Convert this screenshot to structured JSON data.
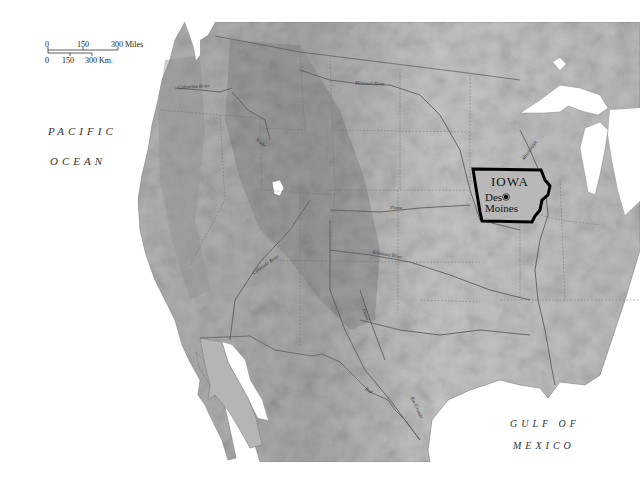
{
  "map": {
    "title": "Location of Iowa in the United States",
    "highlighted_state": "IOWA",
    "capital": "Des Moines",
    "colors": {
      "background": "#ffffff",
      "land": "#bdbdbd",
      "land_light": "#d6d6d6",
      "mountains": "#9a9a9a",
      "water": "#ffffff",
      "iowa_border": "#000000",
      "state_lines": "#6e6e6e"
    }
  },
  "scale_bar": {
    "miles": {
      "ticks": [
        "0",
        "150",
        "300 Miles"
      ]
    },
    "km": {
      "ticks": [
        "0",
        "150",
        "300 Km."
      ]
    }
  },
  "water_labels": {
    "pacific_line1": "PACIFIC",
    "pacific_line2": "OCEAN",
    "gulf_line1": "GULF OF",
    "gulf_line2": "MEXICO"
  },
  "rivers": [
    {
      "name": "Columbia River",
      "label": "Columbia River"
    },
    {
      "name": "Missouri River",
      "label": "Missouri River"
    },
    {
      "name": "Snake",
      "label": "Snake"
    },
    {
      "name": "Mississippi",
      "label": "Mississippi"
    },
    {
      "name": "Colorado River",
      "label": "Colorado River"
    },
    {
      "name": "Arkansas River",
      "label": "Arkansas River"
    },
    {
      "name": "Pecos",
      "label": "Pecos"
    },
    {
      "name": "Red",
      "label": "Red"
    },
    {
      "name": "Rio Grande",
      "label": "Rio Grande"
    },
    {
      "name": "Platte",
      "label": "Platte"
    }
  ]
}
